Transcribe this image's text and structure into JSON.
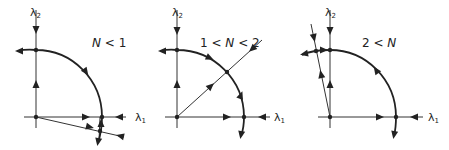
{
  "panels": [
    {
      "id": "panel-1",
      "title": {
        "pre": "",
        "n": "N",
        "post": " < 1"
      },
      "axis_labels": {
        "x": "λ",
        "x_sub": "1",
        "y": "λ",
        "y_sub": "2"
      }
    },
    {
      "id": "panel-2",
      "title": {
        "pre": "1 < ",
        "n": "N",
        "post": " < 2"
      },
      "axis_labels": {
        "x": "λ",
        "x_sub": "1",
        "y": "λ",
        "y_sub": "2"
      }
    },
    {
      "id": "panel-3",
      "title": {
        "pre": "2 < ",
        "n": "N",
        "post": ""
      },
      "axis_labels": {
        "x": "λ",
        "x_sub": "1",
        "y": "λ",
        "y_sub": "2"
      }
    }
  ],
  "colors": {
    "ink": "#222222",
    "background": "#ffffff"
  }
}
